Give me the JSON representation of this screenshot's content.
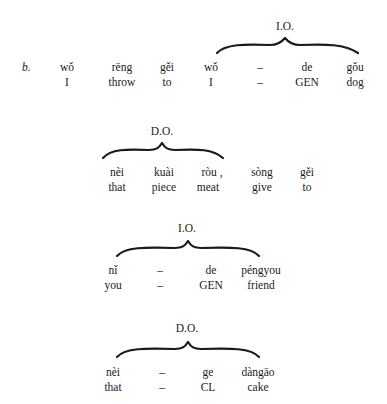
{
  "example_label": "b.",
  "block1": {
    "bracket_label": "I.O.",
    "pinyin": [
      "wǒ",
      "rēng",
      "gěi",
      "wǒ",
      "–",
      "de",
      "gǒu"
    ],
    "gloss": [
      "I",
      "throw",
      "to",
      "I",
      "–",
      "GEN",
      "dog"
    ]
  },
  "block2": {
    "bracket_label": "D.O.",
    "pinyin": [
      "nèi",
      "kuài",
      "ròu ,",
      "sòng",
      "gěi"
    ],
    "gloss": [
      "that",
      "piece",
      "meat",
      "give",
      "to"
    ]
  },
  "block3": {
    "bracket_label": "I.O.",
    "pinyin": [
      "nǐ",
      "–",
      "de",
      "péngyou"
    ],
    "gloss": [
      "you",
      "–",
      "GEN",
      "friend"
    ]
  },
  "block4": {
    "bracket_label": "D.O.",
    "pinyin": [
      "nèi",
      "–",
      "ge",
      "dàngāo"
    ],
    "gloss": [
      "that",
      "–",
      "CL",
      "cake"
    ]
  }
}
